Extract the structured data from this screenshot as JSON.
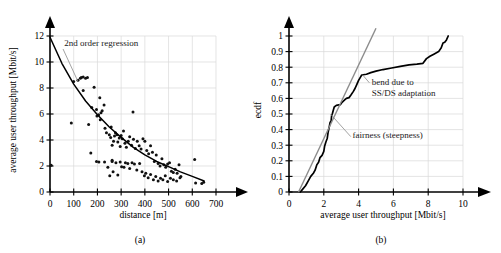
{
  "figure": {
    "panels": [
      {
        "caption": "(a)",
        "chart_data": {
          "type": "scatter",
          "title": "",
          "xlabel": "distance [m]",
          "ylabel": "average user throughput [Mbit/s]",
          "xlim": [
            0,
            700
          ],
          "ylim": [
            0,
            12
          ],
          "xticks": [
            0,
            100,
            200,
            300,
            400,
            500,
            600,
            700
          ],
          "xtick_labels": [
            "0",
            "100",
            "200",
            "300",
            "400",
            "500",
            "600",
            "700"
          ],
          "yticks": [
            0,
            2,
            4,
            6,
            8,
            10,
            12
          ],
          "ytick_labels": [
            "0",
            "2",
            "4",
            "6",
            "8",
            "10",
            "12"
          ],
          "grid": true,
          "legend": "none",
          "annotations": [
            {
              "text": "2nd order regression",
              "x": 60,
              "y": 11.2
            }
          ],
          "series": [
            {
              "name": "measurements",
              "type": "scatter",
              "points": [
                [
                  5,
                  2.05
                ],
                [
                  90,
                  5.3
                ],
                [
                  100,
                  8.5
                ],
                [
                  118,
                  8.6
                ],
                [
                  128,
                  8.75
                ],
                [
                  132,
                  8.8
                ],
                [
                  140,
                  8.85
                ],
                [
                  150,
                  8.75
                ],
                [
                  158,
                  8.8
                ],
                [
                  140,
                  7.8
                ],
                [
                  163,
                  5.2
                ],
                [
                  176,
                  6.5
                ],
                [
                  186,
                  8.05
                ],
                [
                  196,
                  6.35
                ],
                [
                  198,
                  5.85
                ],
                [
                  205,
                  5.95
                ],
                [
                  210,
                  7.25
                ],
                [
                  212,
                  5.55
                ],
                [
                  215,
                  6.1
                ],
                [
                  220,
                  6.25
                ],
                [
                  228,
                  6.7
                ],
                [
                  172,
                  3.0
                ],
                [
                  196,
                  2.35
                ],
                [
                  206,
                  2.3
                ],
                [
                  232,
                  4.9
                ],
                [
                  238,
                  4.55
                ],
                [
                  250,
                  4.4
                ],
                [
                  256,
                  4.2
                ],
                [
                  258,
                  5.0
                ],
                [
                  262,
                  3.6
                ],
                [
                  268,
                  3.9
                ],
                [
                  272,
                  4.3
                ],
                [
                  276,
                  4.55
                ],
                [
                  282,
                  4.4
                ],
                [
                  286,
                  3.85
                ],
                [
                  292,
                  4.15
                ],
                [
                  296,
                  3.5
                ],
                [
                  300,
                  4.35
                ],
                [
                  305,
                  4.1
                ],
                [
                  310,
                  4.7
                ],
                [
                  316,
                  3.75
                ],
                [
                  322,
                  3.45
                ],
                [
                  330,
                  3.9
                ],
                [
                  336,
                  4.25
                ],
                [
                  344,
                  3.6
                ],
                [
                  350,
                  6.15
                ],
                [
                  352,
                  4.05
                ],
                [
                  360,
                  3.35
                ],
                [
                  368,
                  3.9
                ],
                [
                  376,
                  3.55
                ],
                [
                  384,
                  3.3
                ],
                [
                  392,
                  4.1
                ],
                [
                  400,
                  3.9
                ],
                [
                  408,
                  3.2
                ],
                [
                  416,
                  2.95
                ],
                [
                  424,
                  3.55
                ],
                [
                  432,
                  3.05
                ],
                [
                  440,
                  2.35
                ],
                [
                  448,
                  2.85
                ],
                [
                  456,
                  2.2
                ],
                [
                  464,
                  2.0
                ],
                [
                  472,
                  2.55
                ],
                [
                  480,
                  2.1
                ],
                [
                  488,
                  1.9
                ],
                [
                  496,
                  2.15
                ],
                [
                  504,
                  2.25
                ],
                [
                  512,
                  1.6
                ],
                [
                  520,
                  1.5
                ],
                [
                  528,
                  1.75
                ],
                [
                  536,
                  1.45
                ],
                [
                  544,
                  2.1
                ],
                [
                  552,
                  1.2
                ],
                [
                  244,
                  1.9
                ],
                [
                  252,
                  1.25
                ],
                [
                  262,
                  2.35
                ],
                [
                  266,
                  1.55
                ],
                [
                  278,
                  2.25
                ],
                [
                  286,
                  1.3
                ],
                [
                  296,
                  2.3
                ],
                [
                  302,
                  1.95
                ],
                [
                  312,
                  1.9
                ],
                [
                  318,
                  2.25
                ],
                [
                  328,
                  2.2
                ],
                [
                  336,
                  1.8
                ],
                [
                  346,
                  2.25
                ],
                [
                  356,
                  2.15
                ],
                [
                  366,
                  1.7
                ],
                [
                  378,
                  2.2
                ],
                [
                  388,
                  1.55
                ],
                [
                  398,
                  1.25
                ],
                [
                  404,
                  1.45
                ],
                [
                  414,
                  1.1
                ],
                [
                  424,
                  1.35
                ],
                [
                  436,
                  0.95
                ],
                [
                  446,
                  1.2
                ],
                [
                  456,
                  0.85
                ],
                [
                  466,
                  1.05
                ],
                [
                  476,
                  0.95
                ],
                [
                  486,
                  1.25
                ],
                [
                  496,
                  0.8
                ],
                [
                  508,
                  1.05
                ],
                [
                  520,
                  0.95
                ],
                [
                  534,
                  0.85
                ],
                [
                  548,
                  1.1
                ],
                [
                  610,
                  2.5
                ],
                [
                  614,
                  0.7
                ],
                [
                  640,
                  0.65
                ],
                [
                  648,
                  0.75
                ],
                [
                  262,
                  2.45
                ],
                [
                  230,
                  2.3
                ]
              ]
            },
            {
              "name": "2nd order regression",
              "type": "line",
              "points": [
                [
                  0,
                  11.9
                ],
                [
                  50,
                  9.9
                ],
                [
                  100,
                  8.3
                ],
                [
                  150,
                  7.0
                ],
                [
                  200,
                  5.95
                ],
                [
                  250,
                  5.0
                ],
                [
                  300,
                  4.2
                ],
                [
                  350,
                  3.45
                ],
                [
                  400,
                  2.85
                ],
                [
                  450,
                  2.35
                ],
                [
                  500,
                  1.95
                ],
                [
                  550,
                  1.55
                ],
                [
                  600,
                  1.2
                ],
                [
                  650,
                  0.85
                ]
              ]
            }
          ]
        }
      },
      {
        "caption": "(b)",
        "chart_data": {
          "type": "line",
          "title": "",
          "xlabel": "average user throughput [Mbit/s]",
          "ylabel": "ecdf",
          "xlim": [
            0,
            10
          ],
          "ylim": [
            0,
            1
          ],
          "xticks": [
            0,
            2,
            4,
            6,
            8,
            10
          ],
          "xtick_labels": [
            "0",
            "2",
            "4",
            "6",
            "8",
            "10"
          ],
          "yticks": [
            0,
            0.1,
            0.2,
            0.3,
            0.4,
            0.5,
            0.6,
            0.7,
            0.8,
            0.9,
            1
          ],
          "ytick_labels": [
            "0",
            "0.1",
            "0.2",
            "0.3",
            "0.4",
            "0.5",
            "0.6",
            "0.7",
            "0.8",
            "0.9",
            "1"
          ],
          "grid": true,
          "legend": "none",
          "annotations": [
            {
              "text": "bend due to",
              "x": 4.75,
              "y": 0.685
            },
            {
              "text": "SS/DS adaptation",
              "x": 4.75,
              "y": 0.615
            },
            {
              "text": "fairness (steepness)",
              "x": 3.65,
              "y": 0.345
            }
          ],
          "series": [
            {
              "name": "ecdf",
              "type": "line",
              "points": [
                [
                  0.65,
                  0.0
                ],
                [
                  0.8,
                  0.02
                ],
                [
                  0.95,
                  0.04
                ],
                [
                  1.1,
                  0.07
                ],
                [
                  1.25,
                  0.1
                ],
                [
                  1.4,
                  0.12
                ],
                [
                  1.5,
                  0.14
                ],
                [
                  1.6,
                  0.175
                ],
                [
                  1.7,
                  0.19
                ],
                [
                  1.78,
                  0.22
                ],
                [
                  1.9,
                  0.235
                ],
                [
                  2.0,
                  0.26
                ],
                [
                  2.05,
                  0.295
                ],
                [
                  2.12,
                  0.32
                ],
                [
                  2.2,
                  0.345
                ],
                [
                  2.25,
                  0.385
                ],
                [
                  2.3,
                  0.41
                ],
                [
                  2.36,
                  0.445
                ],
                [
                  2.42,
                  0.455
                ],
                [
                  2.45,
                  0.49
                ],
                [
                  2.5,
                  0.505
                ],
                [
                  2.55,
                  0.525
                ],
                [
                  2.6,
                  0.545
                ],
                [
                  2.72,
                  0.555
                ],
                [
                  2.95,
                  0.56
                ],
                [
                  3.05,
                  0.575
                ],
                [
                  3.2,
                  0.59
                ],
                [
                  3.3,
                  0.6
                ],
                [
                  3.45,
                  0.605
                ],
                [
                  3.55,
                  0.62
                ],
                [
                  3.7,
                  0.645
                ],
                [
                  3.8,
                  0.665
                ],
                [
                  3.9,
                  0.69
                ],
                [
                  4.0,
                  0.715
                ],
                [
                  4.1,
                  0.735
                ],
                [
                  4.18,
                  0.75
                ],
                [
                  4.45,
                  0.755
                ],
                [
                  4.7,
                  0.765
                ],
                [
                  5.0,
                  0.775
                ],
                [
                  5.4,
                  0.785
                ],
                [
                  5.9,
                  0.795
                ],
                [
                  6.4,
                  0.805
                ],
                [
                  6.9,
                  0.815
                ],
                [
                  7.35,
                  0.82
                ],
                [
                  7.7,
                  0.825
                ],
                [
                  7.9,
                  0.855
                ],
                [
                  8.1,
                  0.87
                ],
                [
                  8.35,
                  0.885
                ],
                [
                  8.6,
                  0.9
                ],
                [
                  8.75,
                  0.925
                ],
                [
                  8.85,
                  0.955
                ],
                [
                  8.95,
                  0.96
                ],
                [
                  9.05,
                  0.975
                ],
                [
                  9.15,
                  1.0
                ]
              ]
            },
            {
              "name": "fairness (steepness)",
              "type": "line",
              "points": [
                [
                  0.55,
                  0.0
                ],
                [
                  5.0,
                  1.05
                ]
              ]
            }
          ]
        }
      }
    ]
  }
}
